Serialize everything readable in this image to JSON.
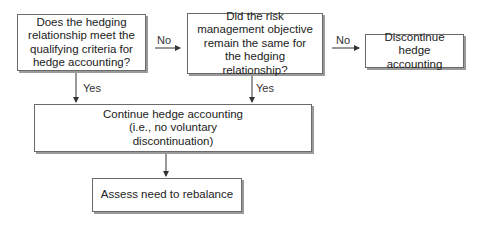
{
  "nodes": {
    "q1": {
      "text": "Does the hedging relationship meet the qualifying criteria for hedge accounting?"
    },
    "q2": {
      "text": "Did the risk management objective remain the same for the hedging relationship?"
    },
    "discontinue": {
      "text": "Discontinue hedge accounting"
    },
    "continue": {
      "text": "Continue hedge accounting (i.e., no voluntary discontinuation)"
    },
    "rebalance": {
      "text": "Assess need to rebalance"
    }
  },
  "edges": {
    "q1_no": {
      "label": "No"
    },
    "q2_no": {
      "label": "No"
    },
    "q1_yes": {
      "label": "Yes"
    },
    "q2_yes": {
      "label": "Yes"
    }
  },
  "colors": {
    "border": "#6a6a6a",
    "shadow": "#9a9a9a",
    "line": "#333333"
  }
}
